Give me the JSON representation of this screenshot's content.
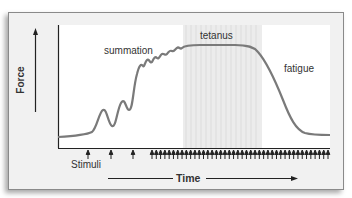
{
  "diagram": {
    "y_axis_label": "Force",
    "x_axis_label": "Time",
    "stimuli_label": "Stimuli",
    "annotations": {
      "summation": "summation",
      "tetanus": "tetanus",
      "fatigue": "fatigue"
    },
    "colors": {
      "curve": "#7a7a7a",
      "tetanus_band": "#e6e6e6",
      "plot_bg": "#ffffff",
      "frame_bg": "#f1f1f1",
      "axis": "#222222"
    },
    "stimuli_arrows_count": 45
  }
}
